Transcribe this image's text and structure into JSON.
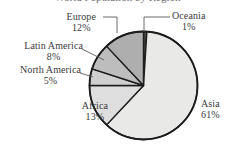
{
  "chart_data": {
    "type": "pie",
    "title": "World Population by Region",
    "subtitle": "",
    "xlabel": "",
    "ylabel": "",
    "legend_position": "none",
    "grid": false,
    "unit": "%",
    "categories": [
      "Oceania",
      "Asia",
      "Africa",
      "North America",
      "Latin America",
      "Europe"
    ],
    "values": [
      1,
      61,
      13,
      5,
      8,
      12
    ],
    "slices": [
      {
        "label": "Oceania",
        "value": 1,
        "value_text": "1%",
        "color": "#4a4a4a",
        "start_angle": 0,
        "end_angle": 3.6
      },
      {
        "label": "Asia",
        "value": 61,
        "value_text": "61%",
        "color": "#e9e9e7",
        "start_angle": 3.6,
        "end_angle": 223.2
      },
      {
        "label": "Africa",
        "value": 13,
        "value_text": "13%",
        "color": "#dedede",
        "start_angle": 223.2,
        "end_angle": 270.0
      },
      {
        "label": "North America",
        "value": 5,
        "value_text": "5%",
        "color": "#cfcfcf",
        "start_angle": 270.0,
        "end_angle": 288.0
      },
      {
        "label": "Latin America",
        "value": 8,
        "value_text": "8%",
        "color": "#bdbdbd",
        "start_angle": 288.0,
        "end_angle": 316.8
      },
      {
        "label": "Europe",
        "value": 12,
        "value_text": "12%",
        "color": "#aeaeae",
        "start_angle": 316.8,
        "end_angle": 360.0
      }
    ]
  },
  "labels": {
    "europe": {
      "name": "Europe",
      "value": "12%"
    },
    "latin_america": {
      "name": "Latin America",
      "value": "8%"
    },
    "north_america": {
      "name": "North America",
      "value": "5%"
    },
    "africa": {
      "name": "Africa",
      "value": "13%"
    },
    "oceania": {
      "name": "Oceania",
      "value": "1%"
    },
    "asia": {
      "name": "Asia",
      "value": "61%"
    }
  },
  "style": {
    "outline_color": "#1c1c1c",
    "leader_color": "#5a5a5a",
    "text_color": "#3a3a3a",
    "background": "#ffffff"
  }
}
